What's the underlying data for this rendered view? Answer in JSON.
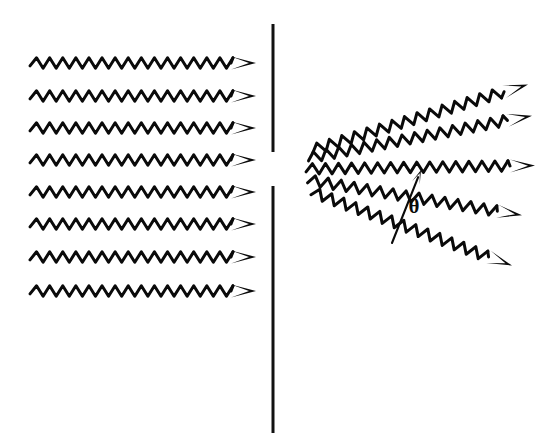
{
  "figure": {
    "background_color": "#ffffff",
    "ink_color": "#0a0a0a",
    "width": 547,
    "height": 442
  },
  "labels": {
    "theta": "θ",
    "theta_name": "diffraction-angle"
  },
  "barrier": {
    "name": "slit-barrier",
    "x": 273,
    "stroke_width": 3.0,
    "upper_segment": {
      "y_top": 24,
      "y_bottom": 152
    },
    "lower_segment": {
      "y_top": 186,
      "y_bottom": 433
    },
    "slit_gap": {
      "y_top": 152,
      "y_bottom": 186,
      "height": 34
    }
  },
  "incident_waves": {
    "name": "incident-plane-waves",
    "count": 8,
    "direction": "left-to-right",
    "x_start": 30,
    "x_end": 233,
    "arrow_tip_x": 256,
    "wavelength": 13.0,
    "amplitude": 5.2,
    "stroke_width": 3.0,
    "baselines_y": [
      63,
      96,
      128,
      160,
      192,
      224,
      257,
      291
    ]
  },
  "diffracted_waves": {
    "name": "diffracted-waves",
    "count": 5,
    "origin": {
      "x": 306,
      "y": 169
    },
    "arrow_tip_x_values": [
      528,
      532,
      535,
      522,
      512
    ],
    "wavelength": 13.0,
    "amplitude": 5.2,
    "stroke_width": 3.0,
    "rays": [
      {
        "name": "diffracted-ray-up-2",
        "angle_deg": -17,
        "start": {
          "x": 312,
          "y": 150
        },
        "end": {
          "x": 500,
          "y": 93
        }
      },
      {
        "name": "diffracted-ray-up-1",
        "angle_deg": -9,
        "start": {
          "x": 308,
          "y": 158
        },
        "end": {
          "x": 504,
          "y": 121
        }
      },
      {
        "name": "diffracted-ray-center",
        "angle_deg": -1,
        "start": {
          "x": 306,
          "y": 169
        },
        "end": {
          "x": 508,
          "y": 166
        }
      },
      {
        "name": "diffracted-ray-down-1",
        "angle_deg": 8,
        "start": {
          "x": 308,
          "y": 180
        },
        "end": {
          "x": 496,
          "y": 211
        }
      },
      {
        "name": "diffracted-ray-down-2",
        "angle_deg": 17,
        "start": {
          "x": 312,
          "y": 192
        },
        "end": {
          "x": 486,
          "y": 256
        }
      }
    ]
  },
  "angle_indicator": {
    "name": "theta-angle-arrow",
    "from": {
      "x": 392,
      "y": 243
    },
    "to": {
      "x": 421,
      "y": 170
    },
    "label_position": {
      "x": 414,
      "y": 213
    }
  },
  "arrow_style": {
    "name": "wave-arrowhead",
    "length": 25,
    "half_width": 6.5,
    "notch": 7
  }
}
